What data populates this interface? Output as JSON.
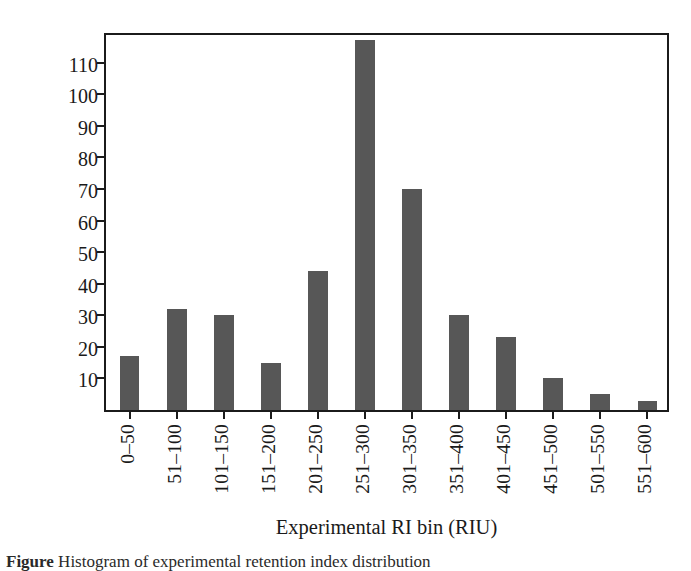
{
  "figure": {
    "caption_prefix": "Figure",
    "caption_text": "Histogram of experimental retention index distribution"
  },
  "chart_data": {
    "type": "bar",
    "title": "",
    "xlabel": "Experimental RI bin (RIU)",
    "ylabel": "Number of compounds",
    "categories": [
      "0–50",
      "51–100",
      "101–150",
      "151–200",
      "201–250",
      "251–300",
      "301–350",
      "351–400",
      "401–450",
      "451–500",
      "501–550",
      "551–600"
    ],
    "values": [
      17,
      32,
      30,
      15,
      44,
      117,
      70,
      30,
      23,
      10,
      5,
      3
    ],
    "ylim": [
      0,
      120
    ],
    "yticks": [
      10,
      20,
      30,
      40,
      50,
      60,
      70,
      80,
      90,
      100,
      110
    ],
    "ytick_labels": [
      "10",
      "20",
      "30",
      "40",
      "50",
      "60",
      "70",
      "80",
      "90",
      "100",
      "110"
    ],
    "grid": false,
    "legend": false,
    "bar_color": "#575757",
    "axis_color": "#1b1b1b",
    "background_color": "#ffffff"
  }
}
